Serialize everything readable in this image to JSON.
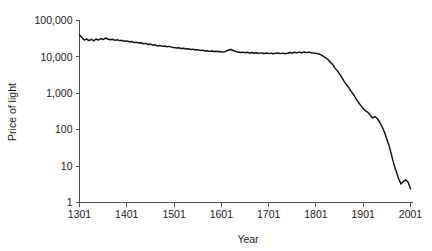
{
  "chart_data": {
    "type": "line",
    "title": "",
    "subtitle": "",
    "xlabel": "Year",
    "ylabel": "Price of light",
    "yscale": "log",
    "xscale": "linear",
    "grid": false,
    "legend": "none",
    "xlim": [
      1301,
      2001
    ],
    "ylim": [
      1,
      100000
    ],
    "xticks": [
      1301,
      1401,
      1501,
      1601,
      1701,
      1801,
      1901,
      2001
    ],
    "xticklabels": [
      "1301",
      "1401",
      "1501",
      "1601",
      "1701",
      "1801",
      "1901",
      "2001"
    ],
    "yticks": [
      1,
      10,
      100,
      1000,
      10000,
      100000
    ],
    "yticklabels": [
      "1",
      "10",
      "100",
      "1,000",
      "10,000",
      "100,000"
    ],
    "line_color": "#111111",
    "axis_color": "#4d4d4d",
    "series": [
      {
        "name": "Price of light",
        "x": [
          1301,
          1306,
          1311,
          1316,
          1321,
          1326,
          1331,
          1336,
          1341,
          1346,
          1351,
          1356,
          1361,
          1366,
          1371,
          1376,
          1381,
          1386,
          1391,
          1396,
          1401,
          1406,
          1411,
          1416,
          1421,
          1426,
          1431,
          1436,
          1441,
          1446,
          1451,
          1456,
          1461,
          1466,
          1471,
          1476,
          1481,
          1486,
          1491,
          1496,
          1501,
          1506,
          1511,
          1516,
          1521,
          1526,
          1531,
          1536,
          1541,
          1546,
          1551,
          1556,
          1561,
          1566,
          1571,
          1576,
          1581,
          1586,
          1591,
          1596,
          1601,
          1606,
          1611,
          1616,
          1621,
          1626,
          1631,
          1636,
          1641,
          1646,
          1651,
          1656,
          1661,
          1666,
          1671,
          1676,
          1681,
          1686,
          1691,
          1696,
          1701,
          1706,
          1711,
          1716,
          1721,
          1726,
          1731,
          1736,
          1741,
          1746,
          1751,
          1756,
          1761,
          1766,
          1771,
          1776,
          1781,
          1786,
          1791,
          1796,
          1801,
          1806,
          1811,
          1816,
          1821,
          1826,
          1831,
          1836,
          1841,
          1846,
          1851,
          1856,
          1861,
          1866,
          1871,
          1876,
          1881,
          1886,
          1891,
          1896,
          1901,
          1906,
          1911,
          1916,
          1921,
          1926,
          1931,
          1936,
          1941,
          1946,
          1951,
          1956,
          1961,
          1966,
          1971,
          1976,
          1981,
          1986,
          1991,
          1996,
          2001
        ],
        "y": [
          40000,
          34000,
          29000,
          31000,
          28000,
          30500,
          27500,
          31000,
          29000,
          32000,
          30000,
          33000,
          31000,
          29500,
          30500,
          28500,
          29500,
          28000,
          28500,
          27000,
          27500,
          26000,
          26500,
          25000,
          25500,
          24000,
          24500,
          23000,
          23500,
          22000,
          22500,
          21000,
          21500,
          20000,
          20500,
          19500,
          20000,
          19000,
          19500,
          18500,
          18000,
          17500,
          17800,
          17000,
          17300,
          16500,
          16800,
          16000,
          16300,
          15500,
          15800,
          15000,
          15300,
          14500,
          14800,
          14200,
          14500,
          14000,
          14300,
          13800,
          14000,
          13500,
          14500,
          15500,
          16000,
          15000,
          14200,
          13600,
          13200,
          13500,
          13000,
          13400,
          12800,
          13200,
          12600,
          13000,
          12500,
          12900,
          12400,
          12800,
          12300,
          12700,
          12200,
          12600,
          12800,
          12300,
          12700,
          12200,
          12600,
          13200,
          12800,
          13400,
          12900,
          13500,
          13000,
          13600,
          13100,
          13500,
          13000,
          12800,
          12500,
          12200,
          11500,
          10500,
          9500,
          8600,
          7200,
          6300,
          5000,
          4200,
          3400,
          2700,
          2100,
          1700,
          1400,
          1100,
          900,
          700,
          560,
          460,
          380,
          330,
          300,
          250,
          210,
          230,
          200,
          160,
          120,
          85,
          55,
          35,
          20,
          11,
          7.0,
          4.5,
          3.2,
          3.8,
          4.2,
          3.6,
          2.4
        ]
      }
    ],
    "annotations": []
  },
  "axes": {
    "x_title": "Year",
    "y_title": "Price of light"
  }
}
